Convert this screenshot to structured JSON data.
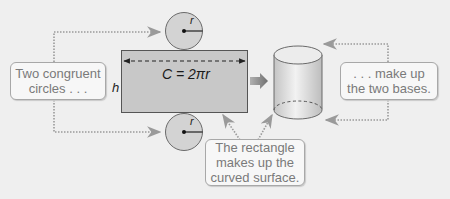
{
  "diagram": {
    "colors": {
      "background": "#efefef",
      "rectangle_fill": "#c8c8c8",
      "circle_fill": "#d3d3d3",
      "stroke": "#555555",
      "dotted_leader": "#9a9a9a",
      "callout_text": "#7a7a7a",
      "arrow": "#8a8a8a"
    },
    "labels": {
      "radius_top": "r",
      "radius_bottom": "r",
      "height": "h",
      "circumference": "C = 2πr"
    },
    "callouts": {
      "left": {
        "line1": "Two congruent",
        "line2": "circles . . ."
      },
      "right": {
        "line1": ". . . make up",
        "line2": "the two bases."
      },
      "bottom": {
        "line1": "The rectangle",
        "line2": "makes up the",
        "line3": "curved surface."
      }
    }
  }
}
